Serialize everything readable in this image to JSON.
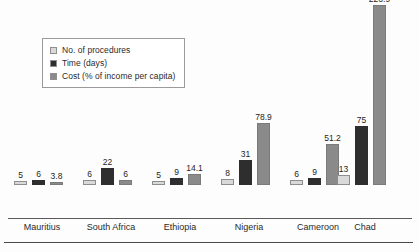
{
  "chart_data": {
    "type": "bar",
    "title": "",
    "subtitle": "",
    "xlabel": "",
    "ylabel": "",
    "grid": false,
    "legend_position": "top-left",
    "axis_max": 240,
    "categories": [
      "Mauritius",
      "South Africa",
      "Ethiopia",
      "Nigeria",
      "Cameroon",
      "Chad"
    ],
    "series": [
      {
        "name": "No. of procedures",
        "color": "#d9d9d9",
        "values": [
          5,
          6,
          5,
          8,
          6,
          13
        ],
        "labels": [
          "5",
          "6",
          "5",
          "8",
          "6",
          "13"
        ]
      },
      {
        "name": "Time (days)",
        "color": "#2e2e2e",
        "values": [
          6,
          22,
          9,
          31,
          9,
          75
        ],
        "labels": [
          "6",
          "22",
          "9",
          "31",
          "9",
          "75"
        ]
      },
      {
        "name": "Cost (% of income per capita)",
        "color": "#8a8a8a",
        "values": [
          3.8,
          6,
          14.1,
          78.9,
          51.2,
          226.9
        ],
        "labels": [
          "3.8",
          "6",
          "14.1",
          "78.9",
          "51.2",
          "226.9"
        ]
      }
    ]
  },
  "legend": {
    "items": [
      {
        "label": "No. of procedures",
        "color": "#d9d9d9"
      },
      {
        "label": "Time (days)",
        "color": "#2e2e2e"
      },
      {
        "label": "Cost (% of income per capita)",
        "color": "#8a8a8a"
      }
    ]
  },
  "footer": {
    "caption_clipped": ""
  }
}
